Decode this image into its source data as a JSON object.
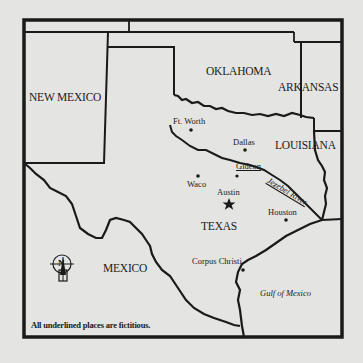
{
  "map": {
    "title": "Texas region map",
    "states": {
      "new_mexico": "NEW MEXICO",
      "oklahoma": "OKLAHOMA",
      "arkansas": "ARKANSAS",
      "louisiana": "LOUISIANA",
      "texas": "TEXAS",
      "mexico": "MEXICO"
    },
    "cities": {
      "ft_worth": "Ft. Worth",
      "dallas": "Dallas",
      "gideon": "Gideon",
      "waco": "Waco",
      "austin": "Austin",
      "houston": "Houston",
      "corpus_christi": "Corpus Christi"
    },
    "water": {
      "jezebel_river": "Jezebel River",
      "gulf": "Gulf of Mexico"
    },
    "compass": {
      "letter": "N"
    },
    "note": "All underlined places are fictitious.",
    "colors": {
      "background": "#e4e4e2",
      "ink": "#1a1a1a"
    }
  }
}
